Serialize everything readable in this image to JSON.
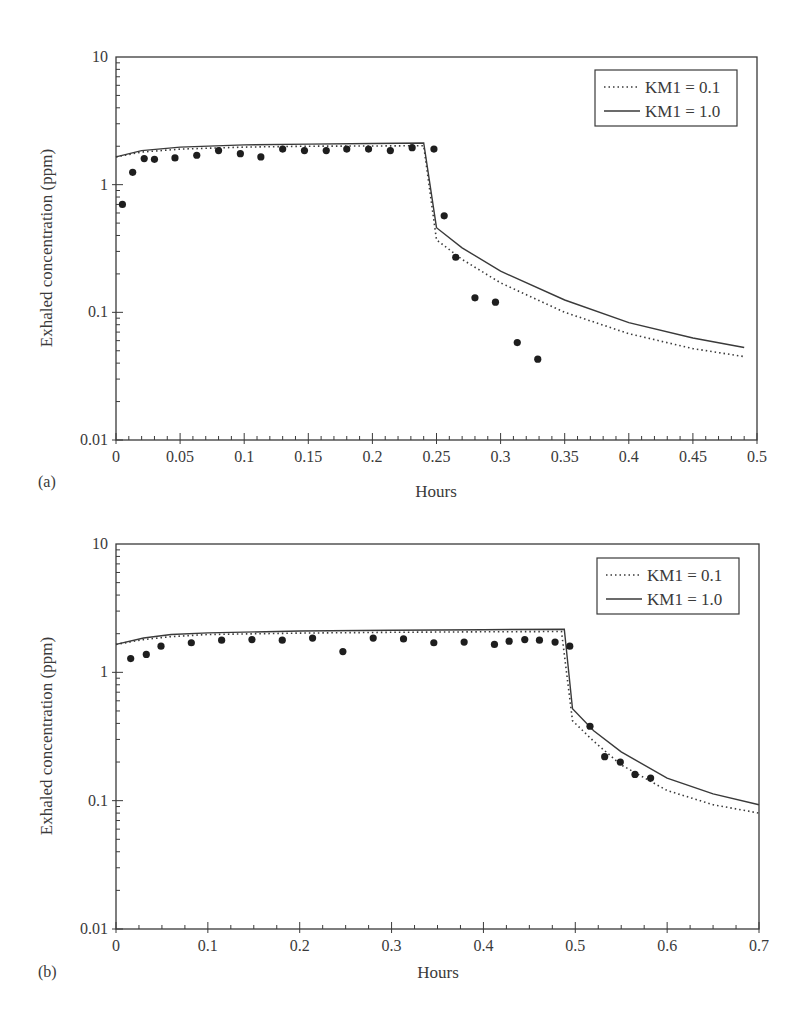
{
  "chart_data": [
    {
      "panel": "(a)",
      "type": "line",
      "title": "",
      "xlabel": "Hours",
      "ylabel": "Exhaled concentration (ppm)",
      "yscale": "log",
      "xlim": [
        0,
        0.5
      ],
      "ylim": [
        0.01,
        10
      ],
      "grid": false,
      "legend_position": "upper right",
      "xticks": [
        0,
        0.05,
        0.1,
        0.15,
        0.2,
        0.25,
        0.3,
        0.35,
        0.4,
        0.45,
        0.5
      ],
      "xtick_labels": [
        "0",
        "0.05",
        "0.1",
        "0.15",
        "0.2",
        "0.25",
        "0.3",
        "0.35",
        "0.4",
        "0.45",
        "0.5"
      ],
      "yticks": [
        0.01,
        0.1,
        1,
        10
      ],
      "ytick_labels": [
        "0.01",
        "0.1",
        "1",
        "10"
      ],
      "series": [
        {
          "name": "KM1 = 0.1",
          "style": "dotted",
          "x": [
            0,
            0.02,
            0.05,
            0.1,
            0.15,
            0.2,
            0.24,
            0.25,
            0.27,
            0.3,
            0.35,
            0.4,
            0.45,
            0.49
          ],
          "y": [
            1.65,
            1.8,
            1.9,
            1.97,
            2.0,
            2.01,
            2.02,
            0.37,
            0.26,
            0.17,
            0.1,
            0.068,
            0.052,
            0.045
          ]
        },
        {
          "name": "KM1 = 1.0",
          "style": "solid",
          "x": [
            0,
            0.02,
            0.05,
            0.1,
            0.15,
            0.2,
            0.24,
            0.25,
            0.27,
            0.3,
            0.35,
            0.4,
            0.45,
            0.49
          ],
          "y": [
            1.65,
            1.85,
            1.97,
            2.05,
            2.08,
            2.1,
            2.12,
            0.46,
            0.32,
            0.21,
            0.125,
            0.083,
            0.063,
            0.053
          ]
        },
        {
          "name": "Observed",
          "style": "markers",
          "x": [
            0.005,
            0.013,
            0.022,
            0.03,
            0.046,
            0.063,
            0.08,
            0.097,
            0.113,
            0.13,
            0.147,
            0.164,
            0.18,
            0.197,
            0.214,
            0.231,
            0.248,
            0.256,
            0.265,
            0.28,
            0.296,
            0.313,
            0.329
          ],
          "y": [
            0.7,
            1.25,
            1.6,
            1.58,
            1.62,
            1.7,
            1.85,
            1.75,
            1.65,
            1.9,
            1.85,
            1.85,
            1.9,
            1.9,
            1.85,
            1.95,
            1.9,
            0.57,
            0.27,
            0.13,
            0.12,
            0.058,
            0.043
          ]
        }
      ]
    },
    {
      "panel": "(b)",
      "type": "line",
      "title": "",
      "xlabel": "Hours",
      "ylabel": "Exhaled concentration (ppm)",
      "yscale": "log",
      "xlim": [
        0,
        0.7
      ],
      "ylim": [
        0.01,
        10
      ],
      "grid": false,
      "legend_position": "upper right",
      "xticks": [
        0,
        0.1,
        0.2,
        0.3,
        0.4,
        0.5,
        0.6,
        0.7
      ],
      "xtick_labels": [
        "0",
        "0.1",
        "0.2",
        "0.3",
        "0.4",
        "0.5",
        "0.6",
        "0.7"
      ],
      "yticks": [
        0.01,
        0.1,
        1,
        10
      ],
      "ytick_labels": [
        "0.01",
        "0.1",
        "1",
        "10"
      ],
      "series": [
        {
          "name": "KM1 = 0.1",
          "style": "dotted",
          "x": [
            0,
            0.03,
            0.06,
            0.1,
            0.2,
            0.3,
            0.4,
            0.485,
            0.497,
            0.52,
            0.55,
            0.6,
            0.65,
            0.7
          ],
          "y": [
            1.65,
            1.8,
            1.9,
            1.97,
            2.02,
            2.05,
            2.07,
            2.08,
            0.42,
            0.29,
            0.19,
            0.12,
            0.093,
            0.08
          ]
        },
        {
          "name": "KM1 = 1.0",
          "style": "solid",
          "x": [
            0,
            0.03,
            0.06,
            0.1,
            0.2,
            0.3,
            0.4,
            0.488,
            0.497,
            0.52,
            0.55,
            0.6,
            0.65,
            0.7
          ],
          "y": [
            1.65,
            1.85,
            1.97,
            2.03,
            2.1,
            2.13,
            2.15,
            2.17,
            0.52,
            0.35,
            0.24,
            0.15,
            0.113,
            0.093
          ]
        },
        {
          "name": "Observed",
          "style": "markers",
          "x": [
            0.016,
            0.033,
            0.049,
            0.082,
            0.115,
            0.148,
            0.181,
            0.214,
            0.247,
            0.28,
            0.313,
            0.346,
            0.379,
            0.412,
            0.428,
            0.445,
            0.461,
            0.478,
            0.494,
            0.516,
            0.532,
            0.549,
            0.565,
            0.582
          ],
          "y": [
            1.28,
            1.38,
            1.6,
            1.7,
            1.78,
            1.8,
            1.78,
            1.85,
            1.45,
            1.85,
            1.82,
            1.7,
            1.72,
            1.65,
            1.75,
            1.8,
            1.78,
            1.72,
            1.6,
            0.38,
            0.22,
            0.2,
            0.16,
            0.15
          ]
        }
      ]
    }
  ],
  "legend": {
    "entry_1": "KM1 = 0.1",
    "entry_2": "KM1 = 1.0"
  },
  "panels": {
    "a": {
      "label": "(a)",
      "xlabel": "Hours",
      "ylabel": "Exhaled concentration (ppm)"
    },
    "b": {
      "label": "(b)",
      "xlabel": "Hours",
      "ylabel": "Exhaled concentration (ppm)"
    }
  },
  "colors": {
    "ink": "#3a3a3a",
    "marker": "#1e1e1e",
    "background": "#ffffff"
  }
}
